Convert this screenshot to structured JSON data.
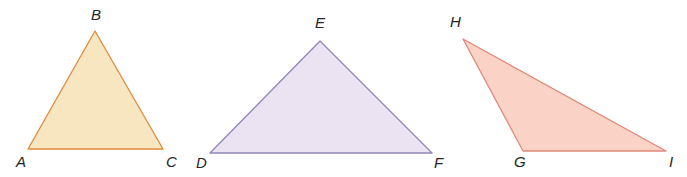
{
  "figure": {
    "background_color": "#ffffff",
    "width": 687,
    "height": 177,
    "label_color": "#262626"
  },
  "triangles": [
    {
      "id": "abc",
      "name": "triangle-abc",
      "fill": "#f8e6c0",
      "stroke": "#e08a3c",
      "stroke_width": 1.3,
      "points": "28,149 95,31 163,149",
      "vertices": [
        {
          "label": "A",
          "x": 28,
          "y": 149,
          "label_x": 16,
          "label_y": 154
        },
        {
          "label": "B",
          "x": 95,
          "y": 31,
          "label_x": 91,
          "label_y": 7
        },
        {
          "label": "C",
          "x": 163,
          "y": 149,
          "label_x": 166,
          "label_y": 154
        }
      ]
    },
    {
      "id": "def",
      "name": "triangle-def",
      "fill": "#ece3f2",
      "stroke": "#9187b8",
      "stroke_width": 1.3,
      "points": "210,153 320,41 432,153",
      "vertices": [
        {
          "label": "D",
          "x": 210,
          "y": 153,
          "label_x": 196,
          "label_y": 155
        },
        {
          "label": "E",
          "x": 320,
          "y": 41,
          "label_x": 315,
          "label_y": 15
        },
        {
          "label": "F",
          "x": 432,
          "y": 153,
          "label_x": 434,
          "label_y": 155
        }
      ]
    },
    {
      "id": "ghi",
      "name": "triangle-ghi",
      "fill": "#fbd2c6",
      "stroke": "#e08a7a",
      "stroke_width": 1.3,
      "points": "463,39 523,151 666,151",
      "vertices": [
        {
          "label": "H",
          "x": 463,
          "y": 39,
          "label_x": 450,
          "label_y": 14
        },
        {
          "label": "G",
          "x": 523,
          "y": 151,
          "label_x": 514,
          "label_y": 154
        },
        {
          "label": "I",
          "x": 666,
          "y": 151,
          "label_x": 669,
          "label_y": 154
        }
      ]
    }
  ]
}
